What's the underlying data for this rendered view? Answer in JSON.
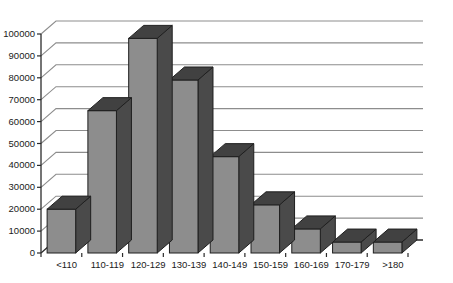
{
  "chart_data": {
    "type": "bar",
    "title": "",
    "subtitle": "",
    "xlabel": "",
    "ylabel": "",
    "categories": [
      "<110",
      "110-119",
      "120-129",
      "130-139",
      "140-149",
      "150-159",
      "160-169",
      "170-179",
      ">180"
    ],
    "values": [
      20000,
      65000,
      98000,
      79000,
      44000,
      22000,
      11000,
      5000,
      5000
    ],
    "series": [
      {
        "name": "Count",
        "values": [
          20000,
          65000,
          98000,
          79000,
          44000,
          22000,
          11000,
          5000,
          5000
        ]
      }
    ],
    "ylim": [
      0,
      100000
    ],
    "ytick_values": [
      0,
      10000,
      20000,
      30000,
      40000,
      50000,
      60000,
      70000,
      80000,
      90000,
      100000
    ],
    "ytick_labels": [
      "0",
      "10000",
      "20000",
      "30000",
      "40000",
      "50000",
      "60000",
      "70000",
      "80000",
      "90000",
      "100000"
    ],
    "grid": true,
    "grid_axis": "y",
    "legend": false,
    "legend_position": "none",
    "three_d": true,
    "annotations": [],
    "colors": {
      "bar_front": "#8d8d8d",
      "bar_side": "#4a4a4a",
      "bar_top": "#414141",
      "gridline": "#8d8d8d",
      "axis": "#2b2b2b",
      "text": "#1a1a1a",
      "background": "#ffffff"
    }
  }
}
